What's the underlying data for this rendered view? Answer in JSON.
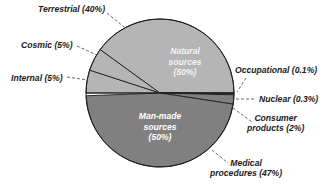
{
  "chart_data": {
    "type": "pie",
    "title": "",
    "groups": [
      {
        "name": "Natural sources",
        "label_lines": [
          "Natural",
          "sources",
          "(50%)"
        ],
        "value": 50,
        "color": "#b5b5b5",
        "slices": [
          {
            "name": "Internal",
            "value": 5,
            "label": "Internal (5%)"
          },
          {
            "name": "Cosmic",
            "value": 5,
            "label": "Cosmic (5%)"
          },
          {
            "name": "Terrestrial",
            "value": 40,
            "label": "Terrestrial (40%)"
          }
        ]
      },
      {
        "name": "Man-made sources",
        "label_lines": [
          "Man-made",
          "sources",
          "(50%)"
        ],
        "value": 50,
        "color": "#808080",
        "slices": [
          {
            "name": "Occupational",
            "value": 0.1,
            "label": "Occupational (0.1%)"
          },
          {
            "name": "Nuclear",
            "value": 0.3,
            "label": "Nuclear (0.3%)"
          },
          {
            "name": "Consumer products",
            "value": 2,
            "label_lines": [
              "Consumer",
              "products (2%)"
            ]
          },
          {
            "name": "Medical procedures",
            "value": 47,
            "label_lines": [
              "Medical",
              "procedures (47%)"
            ]
          }
        ]
      }
    ],
    "categories": [
      "Terrestrial",
      "Cosmic",
      "Internal",
      "Occupational",
      "Nuclear",
      "Consumer products",
      "Medical procedures"
    ],
    "values": [
      40,
      5,
      5,
      0.1,
      0.3,
      2,
      47
    ],
    "legend": "none (callout labels)"
  },
  "labels": {
    "terrestrial": "Terrestrial (40%)",
    "cosmic": "Cosmic (5%)",
    "internal": "Internal (5%)",
    "occupational": "Occupational (0.1%)",
    "nuclear": "Nuclear (0.3%)",
    "consumer_1": "Consumer",
    "consumer_2": "products (2%)",
    "medical_1": "Medical",
    "medical_2": "procedures (47%)",
    "natural_1": "Natural",
    "natural_2": "sources",
    "natural_3": "(50%)",
    "manmade_1": "Man-made",
    "manmade_2": "sources",
    "manmade_3": "(50%)"
  }
}
